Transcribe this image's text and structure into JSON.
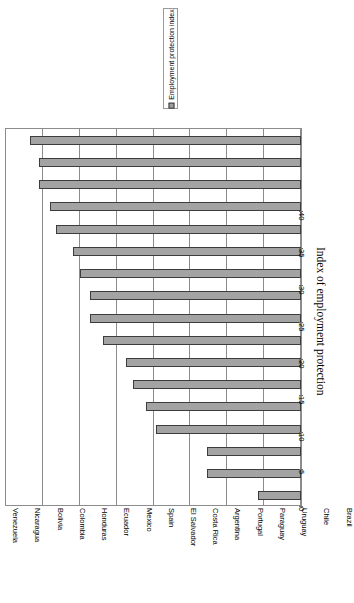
{
  "legend": {
    "label": "Employment protection index",
    "swatch_color": "#9e9e9e",
    "position": "top-center-rotated"
  },
  "axis_title": "Index of employment protection",
  "chart_data": {
    "type": "bar",
    "orientation": "rotated-90",
    "title": "",
    "xlabel": "",
    "ylabel": "Index of employment protection",
    "ylim": [
      0,
      40
    ],
    "ytick_step": 5,
    "yticks": [
      "0",
      "5",
      "10",
      "15",
      "20",
      "25",
      "30",
      "35",
      "40"
    ],
    "grid": true,
    "legend_entries": [
      "Employment protection index"
    ],
    "bar_color": "#a3a3a3",
    "bar_border_color": "#3d3d3d",
    "categories": [
      "Venezuela",
      "Nicaragua",
      "Bolivia",
      "Colombia",
      "Honduras",
      "Ecuador",
      "Mexico",
      "Spain",
      "El Salvador",
      "Costa Rica",
      "Argentina",
      "Portugal",
      "Paraguay",
      "Uruguay",
      "Chile",
      "Brazil",
      "Dominican Republic"
    ],
    "values": [
      36.8,
      35.5,
      35.5,
      34.1,
      33.2,
      30.9,
      30.0,
      28.6,
      28.6,
      26.9,
      23.7,
      22.8,
      21.0,
      19.6,
      12.8,
      12.8,
      5.9
    ]
  }
}
